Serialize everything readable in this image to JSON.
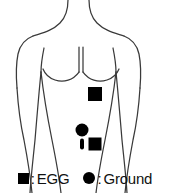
{
  "figure": {
    "background_color": "#ffffff",
    "outline_color": "#3a3a3a",
    "marker_color": "#000000"
  },
  "body_diagram": {
    "view": "anterior-torso",
    "description": "Line drawing of human torso with shoulders, arms, neck and chest lines"
  },
  "electrodes": [
    {
      "id": "egg-upper",
      "type": "square",
      "label": "EGG",
      "x": 95,
      "y": 94,
      "size": 14,
      "color": "#000000"
    },
    {
      "id": "ground",
      "type": "circle",
      "label": "Ground",
      "x": 82,
      "y": 130,
      "size": 13,
      "color": "#000000"
    },
    {
      "id": "marker-capsule",
      "type": "capsule",
      "label": "",
      "x": 82,
      "y": 144,
      "width": 4,
      "height": 11,
      "color": "#000000"
    },
    {
      "id": "egg-lower",
      "type": "square",
      "label": "EGG",
      "x": 95,
      "y": 144,
      "size": 13,
      "color": "#000000"
    }
  ],
  "legend": {
    "items": [
      {
        "marker": "square",
        "separator": ":",
        "label": "EGG"
      },
      {
        "marker": "circle",
        "separator": ":",
        "label": "Ground"
      }
    ]
  }
}
